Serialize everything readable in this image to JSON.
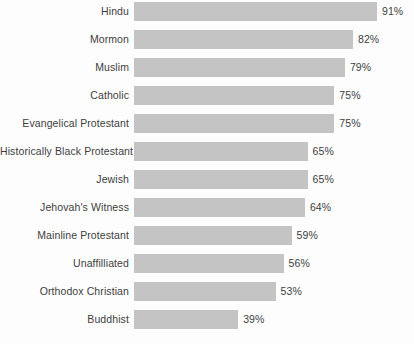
{
  "chart_data": {
    "type": "bar",
    "orientation": "horizontal",
    "title": "",
    "subtitle": "",
    "xlabel": "",
    "ylabel": "",
    "xlim": [
      0,
      100
    ],
    "grid": false,
    "legend": null,
    "value_suffix": "%",
    "bar_color": "#c4c4c4",
    "text_color": "#3d3d3d",
    "background_color": "#fdfdfd",
    "categories": [
      "Hindu",
      "Mormon",
      "Muslim",
      "Catholic",
      "Evangelical Protestant",
      "Historically Black Protestant",
      "Jewish",
      "Jehovah's Witness",
      "Mainline Protestant",
      "Unaffilliated",
      "Orthodox Christian",
      "Buddhist"
    ],
    "values": [
      91,
      82,
      79,
      75,
      75,
      65,
      65,
      64,
      59,
      56,
      53,
      39
    ],
    "rows": [
      {
        "label": "Hindu",
        "value": 91,
        "value_label": "91%"
      },
      {
        "label": "Mormon",
        "value": 82,
        "value_label": "82%"
      },
      {
        "label": "Muslim",
        "value": 79,
        "value_label": "79%"
      },
      {
        "label": "Catholic",
        "value": 75,
        "value_label": "75%"
      },
      {
        "label": "Evangelical Protestant",
        "value": 75,
        "value_label": "75%"
      },
      {
        "label": "Historically Black Protestant",
        "value": 65,
        "value_label": "65%"
      },
      {
        "label": "Jewish",
        "value": 65,
        "value_label": "65%"
      },
      {
        "label": "Jehovah's Witness",
        "value": 64,
        "value_label": "64%"
      },
      {
        "label": "Mainline Protestant",
        "value": 59,
        "value_label": "59%"
      },
      {
        "label": "Unaffilliated",
        "value": 56,
        "value_label": "56%"
      },
      {
        "label": "Orthodox Christian",
        "value": 53,
        "value_label": "53%"
      },
      {
        "label": "Buddhist",
        "value": 39,
        "value_label": "39%"
      }
    ]
  }
}
